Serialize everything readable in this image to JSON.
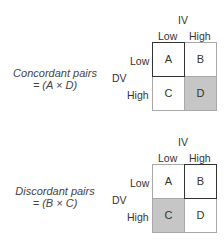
{
  "panels": [
    {
      "caption_line1": "Concordant pairs",
      "caption_line2": "= (A × D)",
      "iv_label": "IV",
      "dv_label": "DV",
      "col_labels": [
        "Low",
        "High"
      ],
      "row_labels": [
        "Low",
        "High"
      ],
      "cells": [
        {
          "label": "A",
          "shaded": false,
          "outlined": true
        },
        {
          "label": "B",
          "shaded": false,
          "outlined": false
        },
        {
          "label": "C",
          "shaded": false,
          "outlined": false
        },
        {
          "label": "D",
          "shaded": true,
          "outlined": false
        }
      ]
    },
    {
      "caption_line1": "Discordant pairs",
      "caption_line2": "= (B × C)",
      "iv_label": "IV",
      "dv_label": "DV",
      "col_labels": [
        "Low",
        "High"
      ],
      "row_labels": [
        "Low",
        "High"
      ],
      "cells": [
        {
          "label": "A",
          "shaded": false,
          "outlined": false
        },
        {
          "label": "B",
          "shaded": false,
          "outlined": true
        },
        {
          "label": "C",
          "shaded": true,
          "outlined": false
        },
        {
          "label": "D",
          "shaded": false,
          "outlined": false
        }
      ]
    }
  ],
  "colors": {
    "shade": "#c6c6c6",
    "outline": "#333333",
    "grid_line": "#a8a8a8"
  }
}
